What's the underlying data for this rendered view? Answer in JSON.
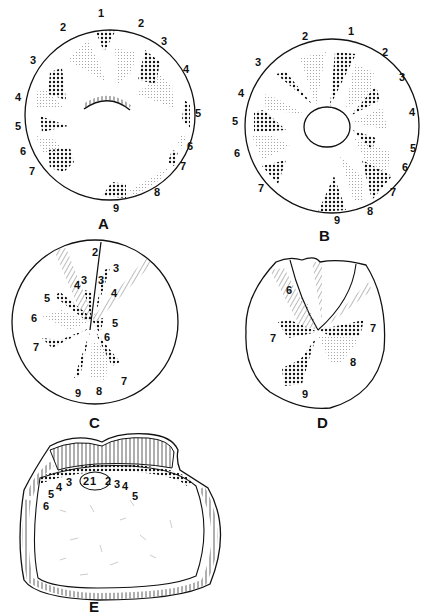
{
  "figure": {
    "panels": [
      {
        "id": "A",
        "label": "A",
        "numbers": [
          "1",
          "2",
          "2",
          "3",
          "3",
          "4",
          "4",
          "5",
          "5",
          "6",
          "6",
          "7",
          "7",
          "8",
          "9"
        ]
      },
      {
        "id": "B",
        "label": "B",
        "numbers": [
          "1",
          "2",
          "2",
          "3",
          "3",
          "4",
          "4",
          "5",
          "5",
          "6",
          "6",
          "7",
          "7",
          "8",
          "9"
        ]
      },
      {
        "id": "C",
        "label": "C",
        "numbers": [
          "2",
          "3",
          "3",
          "3",
          "4",
          "4",
          "5",
          "5",
          "6",
          "6",
          "7",
          "7",
          "8",
          "9"
        ]
      },
      {
        "id": "D",
        "label": "D",
        "numbers": [
          "6",
          "7",
          "7",
          "8",
          "9"
        ]
      },
      {
        "id": "E",
        "label": "E",
        "numbers": [
          "1",
          "2",
          "2",
          "3",
          "3",
          "4",
          "4",
          "5",
          "5",
          "6"
        ]
      }
    ]
  },
  "colors": {
    "ink": "#111111",
    "stipple": "#9a9a9a",
    "background": "#ffffff"
  }
}
